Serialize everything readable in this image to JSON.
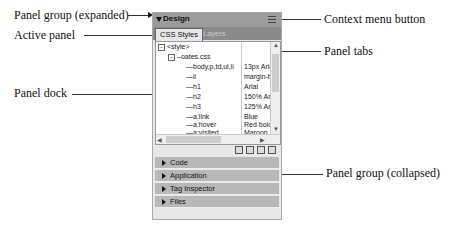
{
  "callouts": {
    "panel_group_expanded": "Panel group (expanded)",
    "active_panel": "Active panel",
    "panel_dock": "Panel dock",
    "context_menu_button": "Context menu button",
    "panel_tabs": "Panel tabs",
    "panel_group_collapsed": "Panel group (collapsed)"
  },
  "panel_group": {
    "title": "Design",
    "context_icon": "options-menu-icon"
  },
  "tabs": [
    {
      "label": "CSS Styles",
      "active": true
    },
    {
      "label": "Layers",
      "active": false
    }
  ],
  "tree": {
    "root": "<style>",
    "file": "oates.css",
    "rules": [
      {
        "selector": "body,p,td,ul,li",
        "value": "13px Aria"
      },
      {
        "selector": "li",
        "value": "margin-b"
      },
      {
        "selector": "h1",
        "value": "Arial"
      },
      {
        "selector": "h2",
        "value": "150% Ar"
      },
      {
        "selector": "h3",
        "value": "125% Ar"
      },
      {
        "selector": "a:link",
        "value": "Blue"
      },
      {
        "selector": "a:hover",
        "value": "Red bold"
      },
      {
        "selector": "a:visited",
        "value": "Maroon"
      }
    ]
  },
  "toolbar_icons": [
    "attach-stylesheet-icon",
    "new-rule-icon",
    "edit-style-icon",
    "delete-icon"
  ],
  "collapsed_groups": [
    {
      "label": "Code"
    },
    {
      "label": "Application"
    },
    {
      "label": "Tag Inspector"
    },
    {
      "label": "Files"
    }
  ]
}
